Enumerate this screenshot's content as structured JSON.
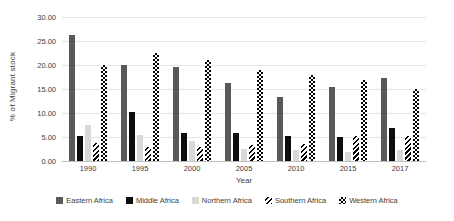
{
  "chart_data": {
    "type": "bar",
    "title": "",
    "xlabel": "Year",
    "ylabel": "% of Migrant stock",
    "categories": [
      "1990",
      "1995",
      "2000",
      "2005",
      "2010",
      "2015",
      "2017"
    ],
    "series": [
      {
        "name": "Eastern Africa",
        "fill": "solid",
        "color": "#595959",
        "values": [
          26.3,
          20.0,
          19.5,
          16.2,
          13.4,
          15.5,
          17.3
        ]
      },
      {
        "name": "Middle Africa",
        "fill": "solid",
        "color": "#0d0d0d",
        "values": [
          5.2,
          10.2,
          5.9,
          5.8,
          5.3,
          4.9,
          6.9
        ]
      },
      {
        "name": "Northern Africa",
        "fill": "solid",
        "color": "#d9d9d9",
        "values": [
          7.4,
          5.5,
          4.2,
          2.4,
          2.2,
          1.8,
          2.2
        ]
      },
      {
        "name": "Southern Africa",
        "fill": "diagonal-stripes",
        "color": "#000000",
        "values": [
          3.7,
          3.0,
          3.0,
          3.3,
          3.6,
          5.3,
          5.3
        ]
      },
      {
        "name": "Western Africa",
        "fill": "checkerboard",
        "color": "#000000",
        "values": [
          20.0,
          22.4,
          21.0,
          19.0,
          18.0,
          16.8,
          15.0
        ]
      }
    ],
    "y_axis": {
      "min": 0,
      "max": 30,
      "step": 5,
      "tick_labels": [
        "0.00",
        "5.00",
        "10.00",
        "15.00",
        "20.00",
        "25.00",
        "30.00"
      ]
    },
    "grid": true,
    "legend_position": "bottom"
  }
}
